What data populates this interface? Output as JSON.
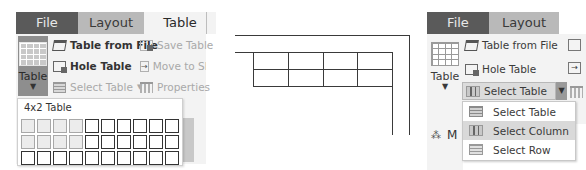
{
  "left": {
    "tabs": [
      {
        "label": "File",
        "state": "dark"
      },
      {
        "label": "Layout",
        "state": "inactive"
      },
      {
        "label": "Table",
        "state": "active"
      }
    ],
    "big_button": {
      "label": "Table",
      "icon": "table-grid-icon"
    },
    "commands": [
      {
        "label": "Table from File",
        "icon": "table-from-file-icon",
        "enabled": true
      },
      {
        "label": "Save Table",
        "icon": "save-table-icon",
        "enabled": false
      },
      {
        "label": "Hole Table",
        "icon": "hole-table-icon",
        "enabled": true
      },
      {
        "label": "Move to Sheet",
        "icon": "move-to-sheet-icon",
        "enabled": false
      },
      {
        "label": "Select Table",
        "icon": "select-table-icon",
        "enabled": false
      },
      {
        "label": "Properties",
        "icon": "properties-icon",
        "enabled": false
      }
    ],
    "grid_popup": {
      "title": "4x2 Table",
      "columns": 10,
      "rows": 3,
      "selected_columns": 4,
      "selected_rows": 2
    }
  },
  "diagram": {
    "table_columns": 4,
    "table_rows": 2
  },
  "right": {
    "tabs": [
      {
        "label": "File",
        "state": "dark"
      },
      {
        "label": "Layout",
        "state": "inactive"
      }
    ],
    "big_button": {
      "label": "Table",
      "icon": "table-grid-icon"
    },
    "commands": [
      {
        "label": "Table from File",
        "icon": "table-from-file-icon"
      },
      {
        "label": "Hole Table",
        "icon": "hole-table-icon"
      }
    ],
    "select_button": {
      "label": "Select Table",
      "icon": "select-table-icon"
    },
    "dropdown": {
      "items": [
        {
          "label": "Select Table",
          "icon": "select-table-icon",
          "highlighted": false
        },
        {
          "label": "Select Column",
          "icon": "select-column-icon",
          "highlighted": true
        },
        {
          "label": "Select Row",
          "icon": "select-row-icon",
          "highlighted": false
        }
      ]
    },
    "partial_label": "M"
  },
  "colors": {
    "file_tab": "#5a5a5a",
    "layout_tab": "#b9b9b9",
    "ribbon_bg": "#f3f3f3",
    "highlight": "#d9d9d9",
    "line": "#3a3a3a"
  }
}
